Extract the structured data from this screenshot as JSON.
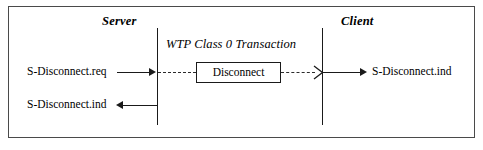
{
  "diagram": {
    "title_left": "Server",
    "title_right": "Client",
    "transaction_label": "WTP Class 0 Transaction",
    "pdu_label": "Disconnect",
    "messages": {
      "server_request": "S-Disconnect.req",
      "server_indication": "S-Disconnect.ind",
      "client_indication": "S-Disconnect.ind"
    },
    "colors": {
      "frame": "#4a4a4a",
      "line": "#1a1a1a",
      "dash": "#2b2b2b",
      "background": "#ffffff",
      "text": "#000000"
    }
  }
}
